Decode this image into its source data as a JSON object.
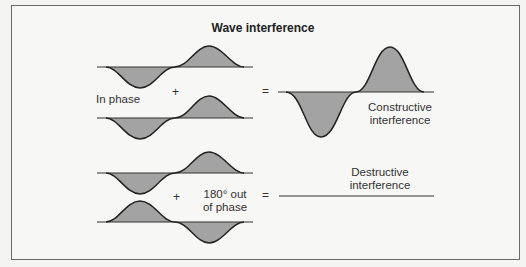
{
  "title": "Wave interference",
  "in_phase": {
    "label": "In phase",
    "plus": "+",
    "equals": "=",
    "result_label_line1": "Constructive",
    "result_label_line2": "interference"
  },
  "out_of_phase": {
    "label_line1": "180° out",
    "label_line2": "of phase",
    "plus": "+",
    "equals": "=",
    "result_label_line1": "Destructive",
    "result_label_line2": "interference"
  },
  "colors": {
    "fill": "#a3a3a3",
    "stroke": "#222222",
    "frame": "#6a6a6a"
  }
}
